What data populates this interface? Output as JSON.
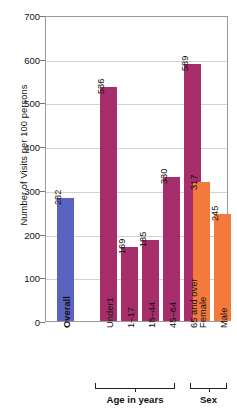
{
  "chart_data": {
    "type": "bar",
    "title": "",
    "xlabel": "",
    "ylabel": "Number of Visits per 100 persons",
    "ylim": [
      0,
      700
    ],
    "ytick_step": 100,
    "yticks": [
      0,
      100,
      200,
      300,
      400,
      500,
      600,
      700
    ],
    "grid": true,
    "legend": "none",
    "categories": [
      "Overall",
      "Under1",
      "1–17",
      "18–44",
      "45–64",
      "65 and over",
      "Female",
      "Male"
    ],
    "values": [
      282,
      536,
      169,
      185,
      330,
      589,
      317,
      245
    ],
    "bar_colors": [
      "#5a63be",
      "#a82e6b",
      "#a82e6b",
      "#a82e6b",
      "#a82e6b",
      "#a82e6b",
      "#f4793c",
      "#f4793c"
    ],
    "groups": [
      {
        "label": "",
        "categories": [
          "Overall"
        ]
      },
      {
        "label": "Age in years",
        "categories": [
          "Under1",
          "1–17",
          "18–44",
          "45–64",
          "65 and over"
        ]
      },
      {
        "label": "Sex",
        "categories": [
          "Female",
          "Male"
        ]
      }
    ]
  },
  "axis": {
    "y_title": "Number of Visits per 100 persons",
    "y_ticks": [
      "700",
      "600",
      "500",
      "400",
      "300",
      "200",
      "100",
      "0"
    ]
  },
  "bars": [
    {
      "label": "Overall",
      "value": "282",
      "color": "#5a63be",
      "bold": true
    },
    {
      "label": "Under1",
      "value": "536",
      "color": "#a82e6b",
      "bold": false
    },
    {
      "label": "1–17",
      "value": "169",
      "color": "#a82e6b",
      "bold": false
    },
    {
      "label": "18–44",
      "value": "185",
      "color": "#a82e6b",
      "bold": false
    },
    {
      "label": "45–64",
      "value": "330",
      "color": "#a82e6b",
      "bold": false
    },
    {
      "label": "65 and over",
      "value": "589",
      "color": "#a82e6b",
      "bold": false
    },
    {
      "label": "Female",
      "value": "317",
      "color": "#f4793c",
      "bold": false
    },
    {
      "label": "Male",
      "value": "245",
      "color": "#f4793c",
      "bold": false
    }
  ],
  "groups": [
    {
      "label": "Age in years"
    },
    {
      "label": "Sex"
    }
  ]
}
